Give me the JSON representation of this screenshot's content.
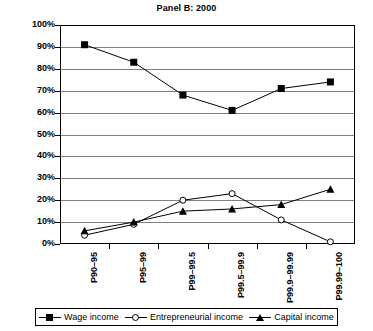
{
  "chart_data": {
    "type": "line",
    "title": "Panel B: 2000",
    "xlabel": "",
    "ylabel": "",
    "ylim": [
      0,
      100
    ],
    "ytick_labels": [
      "100%",
      "90%",
      "80%",
      "70%",
      "60%",
      "50%",
      "40%",
      "30%",
      "20%",
      "10%",
      "0%"
    ],
    "ytick_values": [
      100,
      90,
      80,
      70,
      60,
      50,
      40,
      30,
      20,
      10,
      0
    ],
    "grid": true,
    "legend_position": "bottom",
    "categories": [
      "P90–95",
      "P95–99",
      "P99–99.5",
      "P99.5–99.9",
      "P99.9–99.99",
      "P99.99–100"
    ],
    "series": [
      {
        "name": "Wage income",
        "marker": "filled-square",
        "values": [
          91,
          83,
          68,
          61,
          71,
          74
        ]
      },
      {
        "name": "Entrepreneurial income",
        "marker": "open-circle",
        "values": [
          4,
          9,
          20,
          23,
          11,
          1
        ]
      },
      {
        "name": "Capital income",
        "marker": "filled-triangle",
        "values": [
          6,
          10,
          15,
          16,
          18,
          25
        ]
      }
    ],
    "colors": {
      "series": "#000000",
      "gridline": "#808080",
      "axis": "#000000",
      "background": "#ffffff"
    }
  },
  "legend": {
    "items": [
      {
        "label": "Wage income",
        "glyph": "filled-square-marker-icon"
      },
      {
        "label": "Entrepreneurial income",
        "glyph": "open-circle-marker-icon"
      },
      {
        "label": "Capital income",
        "glyph": "filled-triangle-marker-icon"
      }
    ]
  }
}
